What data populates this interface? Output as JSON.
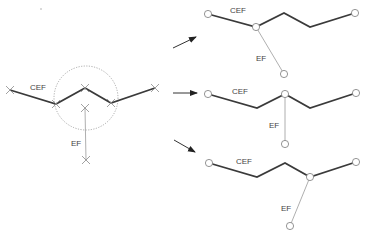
{
  "diagram": {
    "colors": {
      "cef_line": "#3a3a3a",
      "ef_line": "#9a9a9a",
      "node_stroke": "#7a7a7a",
      "label": "#444444"
    },
    "source": {
      "cef_label": "CEF",
      "ef_label": "EF",
      "cef_points": [
        [
          10,
          90
        ],
        [
          56,
          104
        ],
        [
          85,
          88
        ],
        [
          111,
          103
        ],
        [
          155,
          88
        ]
      ],
      "ef_points": [
        [
          85,
          108
        ],
        [
          86,
          160
        ]
      ],
      "circle": {
        "cx": 86,
        "cy": 98,
        "r": 32
      },
      "marker": "x"
    },
    "arrows": [
      {
        "from": [
          173,
          48
        ],
        "to": [
          196,
          37
        ]
      },
      {
        "from": [
          173,
          93
        ],
        "to": [
          197,
          93
        ]
      },
      {
        "from": [
          174,
          140
        ],
        "to": [
          195,
          152
        ]
      }
    ],
    "variants": [
      {
        "cef_label": "CEF",
        "ef_label": "EF",
        "cef_points": [
          [
            208,
            14
          ],
          [
            256,
            27
          ],
          [
            284,
            13
          ],
          [
            310,
            27
          ],
          [
            355,
            13
          ]
        ],
        "ef_points": [
          [
            256,
            27
          ],
          [
            284,
            74
          ]
        ],
        "junction": [
          256,
          27
        ],
        "marker": "circle"
      },
      {
        "cef_label": "CEF",
        "ef_label": "EF",
        "cef_points": [
          [
            208,
            94
          ],
          [
            257,
            108
          ],
          [
            285,
            94
          ],
          [
            310,
            108
          ],
          [
            356,
            93
          ]
        ],
        "ef_points": [
          [
            285,
            94
          ],
          [
            285,
            144
          ]
        ],
        "junction": [
          285,
          94
        ],
        "marker": "circle"
      },
      {
        "cef_label": "CEF",
        "ef_label": "EF",
        "cef_points": [
          [
            209,
            163
          ],
          [
            257,
            177
          ],
          [
            285,
            163
          ],
          [
            310,
            177
          ],
          [
            356,
            162
          ]
        ],
        "ef_points": [
          [
            310,
            177
          ],
          [
            290,
            226
          ]
        ],
        "junction": [
          310,
          177
        ],
        "marker": "circle"
      }
    ]
  }
}
